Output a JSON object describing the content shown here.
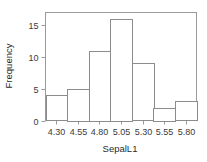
{
  "chart_data": {
    "type": "bar",
    "title": "",
    "subtitle": "",
    "xlabel": "SepalL1",
    "ylabel": "Frequency",
    "categories": [
      "4.30",
      "4.55",
      "4.80",
      "5.05",
      "5.30",
      "5.55",
      "5.80"
    ],
    "bin_edges": [
      4.175,
      4.425,
      4.675,
      4.925,
      5.175,
      5.425,
      5.675,
      5.925
    ],
    "values": [
      4,
      5,
      11,
      16,
      9,
      2,
      3
    ],
    "xtick_labels": [
      "4.30",
      "4.55",
      "4.80",
      "5.05",
      "5.30",
      "5.55",
      "5.80"
    ],
    "ytick_labels": [
      "0",
      "5",
      "10",
      "15"
    ],
    "ytick_values": [
      0,
      5,
      10,
      15
    ],
    "ylim": [
      0,
      17
    ],
    "xlim": [
      4.175,
      5.925
    ],
    "grid": false,
    "legend": false,
    "bar_fill": "#ffffff",
    "bar_stroke": "#8c8c8c",
    "frame_stroke": "#9a9a9a",
    "background": "#ffffff"
  }
}
